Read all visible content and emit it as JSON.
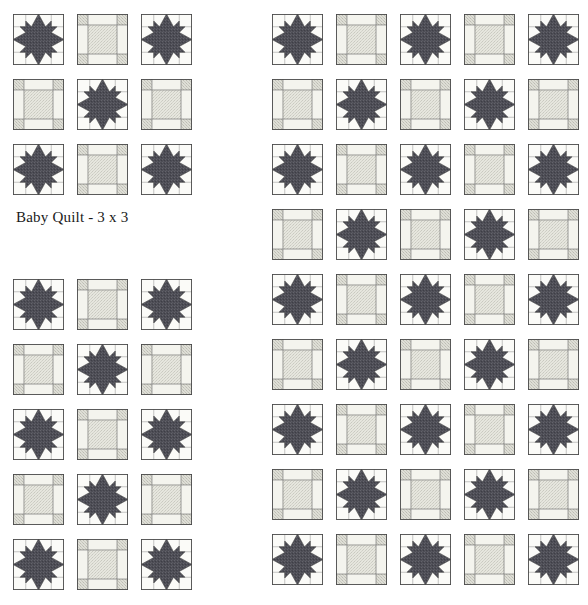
{
  "page": {
    "background_color": "#ffffff"
  },
  "palette": {
    "star_fabric": "#4d4d55",
    "star_fabric_stipple": "#6a6a72",
    "background_fabric": "#fbfbf8",
    "sashing_light": "#f4f4ee",
    "sashing_stipple": "#d8d8d0",
    "corner_stipple": "#cfcfc6",
    "block_border": "#4a4a4a",
    "seam_line": "#6b6b6b",
    "text_color": "#1a1a1a"
  },
  "caption": {
    "text": "Baby Quilt - 3 x 3"
  },
  "block_types": {
    "star": {
      "name": "star-block",
      "description": "Eight-pointed variable star block in dark print fabric on light background"
    },
    "sashing": {
      "name": "sashing-block",
      "description": "Nine-patch sashing block with stippled corner squares, light cross bars and stippled center square"
    }
  },
  "layouts": [
    {
      "id": "baby-quilt-3x3",
      "name": "baby-quilt-grid",
      "label": "Baby Quilt - 3 x 3",
      "columns": 3,
      "rows": 3,
      "block_size": 51,
      "gap_x": 13,
      "gap_y": 14,
      "has_caption": true,
      "blocks": [
        "star",
        "sashing",
        "star",
        "sashing",
        "star",
        "sashing",
        "star",
        "sashing",
        "star"
      ]
    },
    {
      "id": "lap-quilt-3x5",
      "name": "left-long-grid",
      "label": "",
      "columns": 3,
      "rows": 5,
      "block_size": 51,
      "gap_x": 13,
      "gap_y": 14,
      "has_caption": false,
      "blocks": [
        "star",
        "sashing",
        "star",
        "sashing",
        "star",
        "sashing",
        "star",
        "sashing",
        "star",
        "sashing",
        "star",
        "sashing",
        "star",
        "sashing",
        "star"
      ]
    },
    {
      "id": "full-quilt-5x9",
      "name": "right-big-grid",
      "label": "",
      "columns": 5,
      "rows": 9,
      "block_size": 51,
      "gap_x": 13,
      "gap_y": 14,
      "has_caption": false,
      "blocks": [
        "star",
        "sashing",
        "star",
        "sashing",
        "star",
        "sashing",
        "star",
        "sashing",
        "star",
        "sashing",
        "star",
        "sashing",
        "star",
        "sashing",
        "star",
        "sashing",
        "star",
        "sashing",
        "star",
        "sashing",
        "star",
        "sashing",
        "star",
        "sashing",
        "star",
        "sashing",
        "star",
        "sashing",
        "star",
        "sashing",
        "star",
        "sashing",
        "star",
        "sashing",
        "star",
        "sashing",
        "star",
        "sashing",
        "star",
        "sashing",
        "star",
        "sashing",
        "star",
        "sashing",
        "star"
      ]
    }
  ]
}
